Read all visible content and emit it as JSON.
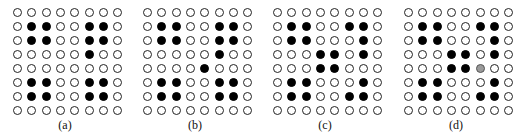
{
  "figure": {
    "legend": {
      "empty": "white circle",
      "filled": "black circle",
      "partial": "gray circle"
    },
    "panels": [
      {
        "label": "(a)",
        "grid": [
          [
            0,
            0,
            0,
            0,
            0,
            0,
            0,
            0
          ],
          [
            0,
            1,
            1,
            0,
            0,
            1,
            1,
            0
          ],
          [
            0,
            1,
            1,
            0,
            0,
            1,
            1,
            0
          ],
          [
            0,
            0,
            0,
            0,
            0,
            1,
            0,
            0
          ],
          [
            0,
            0,
            0,
            0,
            0,
            0,
            0,
            0
          ],
          [
            0,
            1,
            1,
            0,
            0,
            1,
            1,
            0
          ],
          [
            0,
            1,
            1,
            0,
            0,
            1,
            1,
            0
          ],
          [
            0,
            0,
            0,
            0,
            0,
            0,
            0,
            0
          ]
        ]
      },
      {
        "label": "(b)",
        "grid": [
          [
            0,
            0,
            0,
            0,
            0,
            0,
            0,
            0
          ],
          [
            0,
            1,
            1,
            0,
            0,
            1,
            1,
            0
          ],
          [
            0,
            1,
            1,
            0,
            0,
            1,
            1,
            0
          ],
          [
            0,
            0,
            0,
            0,
            0,
            1,
            0,
            0
          ],
          [
            0,
            0,
            0,
            0,
            1,
            0,
            0,
            0
          ],
          [
            0,
            1,
            1,
            0,
            0,
            1,
            1,
            0
          ],
          [
            0,
            1,
            1,
            0,
            0,
            1,
            1,
            0
          ],
          [
            0,
            0,
            0,
            0,
            0,
            0,
            0,
            0
          ]
        ]
      },
      {
        "label": "(c)",
        "grid": [
          [
            0,
            0,
            0,
            0,
            0,
            0,
            0,
            0
          ],
          [
            0,
            1,
            1,
            0,
            0,
            1,
            1,
            0
          ],
          [
            0,
            1,
            1,
            0,
            0,
            0,
            1,
            0
          ],
          [
            0,
            0,
            0,
            1,
            1,
            0,
            1,
            0
          ],
          [
            0,
            0,
            0,
            1,
            1,
            0,
            0,
            0
          ],
          [
            0,
            1,
            1,
            0,
            0,
            0,
            1,
            0
          ],
          [
            0,
            1,
            1,
            0,
            0,
            1,
            1,
            0
          ],
          [
            0,
            0,
            0,
            0,
            0,
            0,
            0,
            0
          ]
        ]
      },
      {
        "label": "(d)",
        "grid": [
          [
            0,
            0,
            0,
            0,
            0,
            0,
            0,
            0
          ],
          [
            0,
            1,
            1,
            0,
            0,
            1,
            1,
            0
          ],
          [
            0,
            1,
            1,
            0,
            0,
            0,
            1,
            0
          ],
          [
            0,
            0,
            0,
            1,
            1,
            0,
            1,
            0
          ],
          [
            0,
            0,
            0,
            1,
            1,
            2,
            0,
            0
          ],
          [
            0,
            1,
            1,
            0,
            0,
            0,
            1,
            0
          ],
          [
            0,
            1,
            1,
            0,
            0,
            1,
            1,
            0
          ],
          [
            0,
            0,
            0,
            0,
            0,
            0,
            0,
            0
          ]
        ]
      }
    ]
  }
}
